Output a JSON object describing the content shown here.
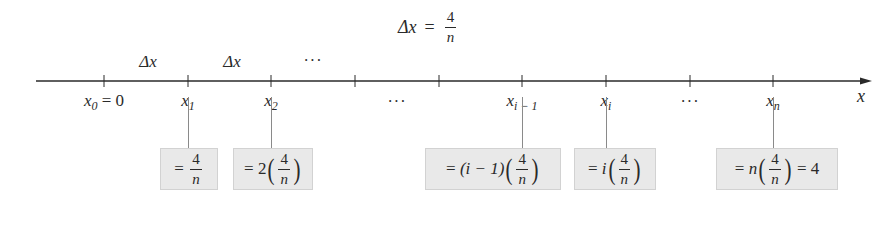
{
  "title": {
    "lhs": "Δx",
    "eq": "=",
    "num": "4",
    "den": "n"
  },
  "axis": {
    "label": "x",
    "color": "#2a2a2a",
    "ticks_x": [
      104,
      188,
      271,
      355,
      439,
      522,
      606,
      690,
      773
    ]
  },
  "interval_labels": [
    {
      "text": "Δx",
      "x": 148
    },
    {
      "text": "Δx",
      "x": 232
    },
    {
      "text": "···",
      "x": 313
    }
  ],
  "tick_labels": [
    {
      "var": "x",
      "sub": "0",
      "suffix": " = 0",
      "x": 104
    },
    {
      "var": "x",
      "sub": "1",
      "suffix": "",
      "x": 188
    },
    {
      "var": "x",
      "sub": "2",
      "suffix": "",
      "x": 271
    },
    {
      "var": "···",
      "sub": "",
      "suffix": "",
      "x": 397
    },
    {
      "var": "x",
      "sub": "i − 1",
      "suffix": "",
      "x": 522
    },
    {
      "var": "x",
      "sub": "i",
      "suffix": "",
      "x": 606
    },
    {
      "var": "···",
      "sub": "",
      "suffix": "",
      "x": 690
    },
    {
      "var": "x",
      "sub": "n",
      "suffix": "",
      "x": 773
    }
  ],
  "boxes": [
    {
      "id": "x1",
      "prefix": "= ",
      "coef": "",
      "num": "4",
      "den": "n",
      "parens": false,
      "suffix": ""
    },
    {
      "id": "x2",
      "prefix": "= ",
      "coef": "2",
      "num": "4",
      "den": "n",
      "parens": true,
      "suffix": ""
    },
    {
      "id": "xi-1",
      "prefix": "= ",
      "coef": "(i − 1)",
      "num": "4",
      "den": "n",
      "parens": true,
      "suffix": ""
    },
    {
      "id": "xi",
      "prefix": "= ",
      "coef": "i",
      "num": "4",
      "den": "n",
      "parens": true,
      "suffix": ""
    },
    {
      "id": "xn",
      "prefix": "= ",
      "coef": "n",
      "num": "4",
      "den": "n",
      "parens": true,
      "suffix": " = 4"
    }
  ],
  "box_fill": "#e9e9e9"
}
